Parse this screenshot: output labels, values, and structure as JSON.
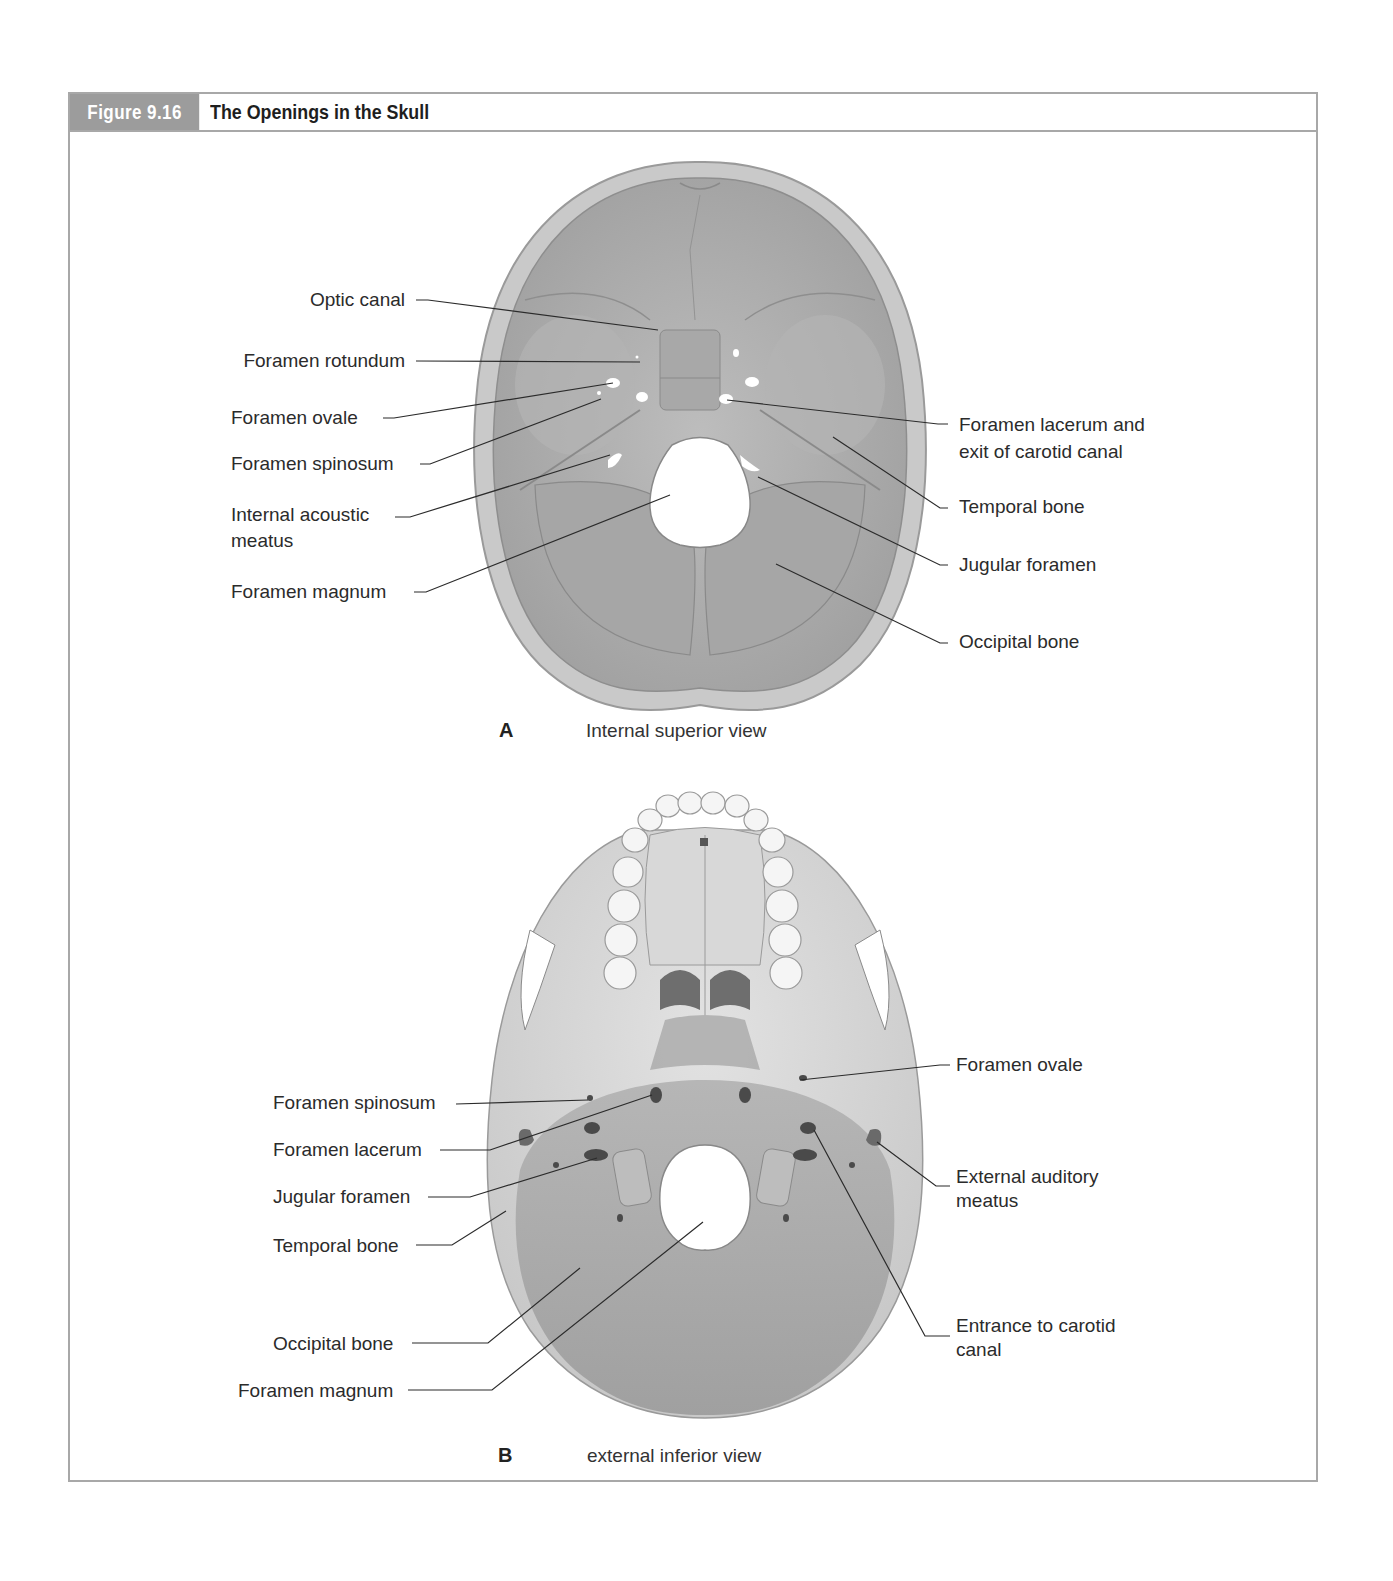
{
  "figure": {
    "number": "Figure 9.16",
    "title": "The Openings in the Skull",
    "accent_color": "#9c9c9c",
    "border_color": "#a8a8a8"
  },
  "panel_a": {
    "letter": "A",
    "caption": "Internal superior view",
    "labels_left": [
      {
        "text": "Optic canal"
      },
      {
        "text": "Foramen rotundum"
      },
      {
        "text": "Foramen ovale"
      },
      {
        "text": "Foramen spinosum"
      },
      {
        "text": "Internal acoustic meatus",
        "line1": "Internal acoustic",
        "line2": "meatus"
      },
      {
        "text": "Foramen magnum"
      }
    ],
    "labels_right": [
      {
        "text": "Foramen lacerum and exit of carotid canal",
        "line1": "Foramen lacerum and",
        "line2": "exit of carotid canal"
      },
      {
        "text": "Temporal bone"
      },
      {
        "text": "Jugular foramen"
      },
      {
        "text": "Occipital bone"
      }
    ]
  },
  "panel_b": {
    "letter": "B",
    "caption": "external inferior view",
    "labels_left": [
      {
        "text": "Foramen spinosum"
      },
      {
        "text": "Foramen lacerum"
      },
      {
        "text": "Jugular foramen"
      },
      {
        "text": "Temporal bone"
      },
      {
        "text": "Occipital bone"
      },
      {
        "text": "Foramen magnum"
      }
    ],
    "labels_right": [
      {
        "text": "Foramen ovale"
      },
      {
        "text": "External auditory meatus",
        "line1": "External auditory",
        "line2": "meatus"
      },
      {
        "text": "Entrance to carotid canal",
        "line1": "Entrance to carotid",
        "line2": "canal"
      }
    ]
  }
}
